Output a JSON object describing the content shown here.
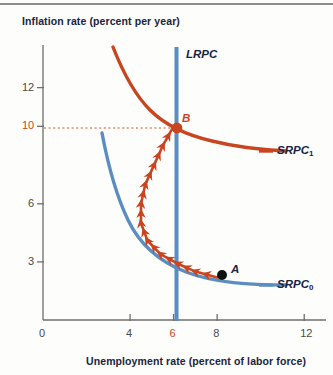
{
  "figure": {
    "background": "#fdfdfc",
    "colors": {
      "red": "#c8451f",
      "blue": "#5b8dc3",
      "axis": "#6e6e6e",
      "text": "#1a2340",
      "tick_text": "#4a4a4a",
      "highlight_tick": "#c8451f"
    }
  },
  "chart_data": {
    "type": "line",
    "title": "",
    "subtitle": "",
    "ylabel": "Inflation rate (percent per year)",
    "xlabel": "Unemployment rate (percent of labor force)",
    "xlim": [
      0,
      13
    ],
    "ylim": [
      0,
      14.2
    ],
    "grid": false,
    "legend_position": "inline-right",
    "xticks": [
      {
        "value": 0,
        "label": "0",
        "highlight": false
      },
      {
        "value": 4,
        "label": "4",
        "highlight": false
      },
      {
        "value": 6,
        "label": "6",
        "highlight": true
      },
      {
        "value": 8,
        "label": "8",
        "highlight": false
      },
      {
        "value": 12,
        "label": "12",
        "highlight": false
      }
    ],
    "yticks": [
      {
        "value": 3,
        "label": "3",
        "highlight": false
      },
      {
        "value": 6,
        "label": "6",
        "highlight": false
      },
      {
        "value": 10,
        "label": "10",
        "highlight": true
      },
      {
        "value": 12,
        "label": "12",
        "highlight": false
      }
    ],
    "series": [
      {
        "name": "LRPC",
        "label": "LRPC",
        "type": "vertical-line",
        "color": "#5b8dc3",
        "x": 6,
        "y_range": [
          0,
          14.2
        ]
      },
      {
        "name": "SRPC0",
        "label": "SRPC",
        "label_sub": "0",
        "type": "curve",
        "color": "#5b8dc3",
        "points": [
          {
            "x": 2.7,
            "y": 9.6
          },
          {
            "x": 3.2,
            "y": 7.6
          },
          {
            "x": 3.8,
            "y": 5.8
          },
          {
            "x": 4.4,
            "y": 4.4
          },
          {
            "x": 5.2,
            "y": 3.3
          },
          {
            "x": 6.0,
            "y": 2.8
          },
          {
            "x": 7.0,
            "y": 2.4
          },
          {
            "x": 8.0,
            "y": 2.2
          },
          {
            "x": 9.5,
            "y": 2.0
          },
          {
            "x": 11.6,
            "y": 1.9
          }
        ]
      },
      {
        "name": "SRPC1",
        "label": "SRPC",
        "label_sub": "1",
        "type": "curve",
        "color": "#c8451f",
        "points": [
          {
            "x": 3.2,
            "y": 14.0
          },
          {
            "x": 3.8,
            "y": 12.6
          },
          {
            "x": 4.4,
            "y": 11.5
          },
          {
            "x": 5.2,
            "y": 10.6
          },
          {
            "x": 6.0,
            "y": 10.0
          },
          {
            "x": 7.2,
            "y": 9.3
          },
          {
            "x": 8.6,
            "y": 8.8
          },
          {
            "x": 10.3,
            "y": 8.4
          },
          {
            "x": 11.6,
            "y": 8.3
          }
        ]
      },
      {
        "name": "adjustment-path",
        "label": "",
        "type": "arrow-path",
        "color": "#c8451f",
        "points": [
          {
            "x": 8.0,
            "y": 2.2
          },
          {
            "x": 7.0,
            "y": 2.5
          },
          {
            "x": 6.2,
            "y": 2.9
          },
          {
            "x": 5.4,
            "y": 3.4
          },
          {
            "x": 4.8,
            "y": 4.1
          },
          {
            "x": 4.5,
            "y": 5.0
          },
          {
            "x": 4.5,
            "y": 6.0
          },
          {
            "x": 4.7,
            "y": 7.0
          },
          {
            "x": 5.1,
            "y": 8.0
          },
          {
            "x": 5.5,
            "y": 9.0
          },
          {
            "x": 6.0,
            "y": 10.0
          }
        ]
      }
    ],
    "points": [
      {
        "name": "A",
        "label": "A",
        "x": 8,
        "y": 2.2,
        "color": "#111111",
        "label_color": "#1a2340"
      },
      {
        "name": "B",
        "label": "B",
        "x": 6,
        "y": 10.0,
        "color": "#c8451f",
        "label_color": "#c8451f"
      }
    ],
    "annotations": [
      {
        "name": "inflation-10-guide",
        "type": "dotted-horizontal",
        "y": 10,
        "x_from": 0,
        "x_to": 6,
        "color": "#e08a6a"
      }
    ]
  }
}
